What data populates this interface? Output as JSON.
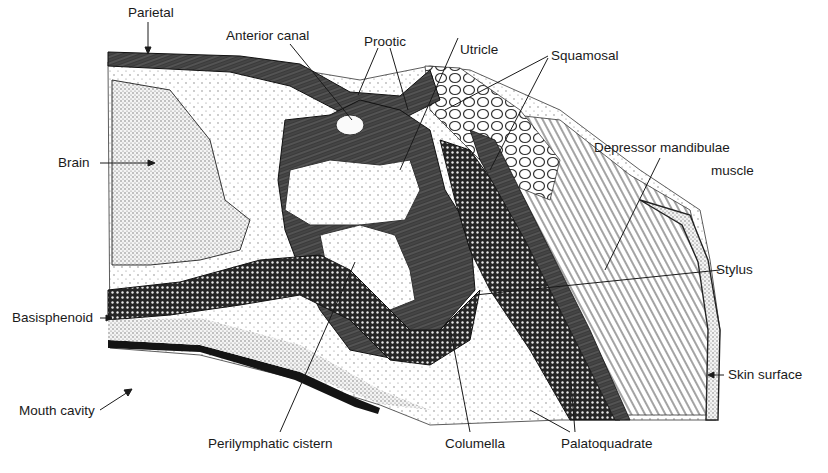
{
  "figure": {
    "type": "anatomical cross-section",
    "colors": {
      "ink": "#1a1a1a",
      "paper": "#ffffff",
      "dark_tissue": "#2b2b2b",
      "stipple": "#6b6b6b"
    }
  },
  "labels": {
    "parietal": "Parietal",
    "anterior_canal": "Anterior canal",
    "prootic": "Prootic",
    "utricle": "Utricle",
    "squamosal": "Squamosal",
    "brain": "Brain",
    "depressor_line1": "Depressor mandibulae",
    "depressor_line2": "muscle",
    "stylus": "Stylus",
    "basisphenoid": "Basisphenoid",
    "skin_surface": "Skin surface",
    "mouth_cavity": "Mouth cavity",
    "perilymphatic_cistern": "Perilymphatic cistern",
    "columella": "Columella",
    "palatoquadrate": "Palatoquadrate"
  }
}
